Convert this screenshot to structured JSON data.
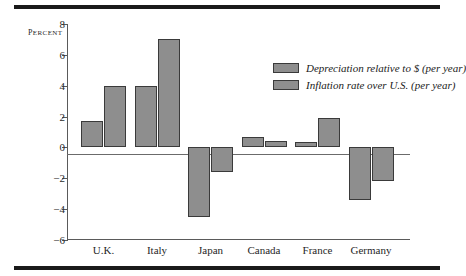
{
  "chart_data": {
    "type": "bar",
    "title": "",
    "xlabel": "",
    "ylabel": "Percent",
    "ylim": [
      -6,
      8
    ],
    "yticks": [
      8,
      6,
      4,
      2,
      0,
      -2,
      -4,
      -6
    ],
    "ytick_labels": [
      "8",
      "6",
      "4",
      "2",
      "0",
      "−2",
      "−4",
      "−6"
    ],
    "grid": false,
    "legend_position": "upper-right-inside",
    "categories": [
      "U.K.",
      "Italy",
      "Japan",
      "Canada",
      "France",
      "Germany"
    ],
    "series": [
      {
        "name": "Depreciation relative to $ (per year)",
        "color": "#8e8e8e",
        "values": [
          1.7,
          4.0,
          -4.5,
          0.7,
          0.35,
          -3.4
        ]
      },
      {
        "name": "Inflation rate over U.S. (per year)",
        "color": "#8e8e8e",
        "values": [
          4.0,
          7.0,
          -1.6,
          0.4,
          1.9,
          -2.2
        ]
      }
    ]
  },
  "axis": {
    "y_title": "Percent"
  },
  "legend": {
    "entries": [
      {
        "label": "Depreciation relative to $ (per year)"
      },
      {
        "label": "Inflation rate over U.S. (per year)"
      }
    ]
  },
  "colors": {
    "bar_fill": "#8e8e8e",
    "bar_edge": "#3a3a3a",
    "axis": "#5a5a5a",
    "rule": "#1a1a1a",
    "text": "#1f1f1f"
  }
}
